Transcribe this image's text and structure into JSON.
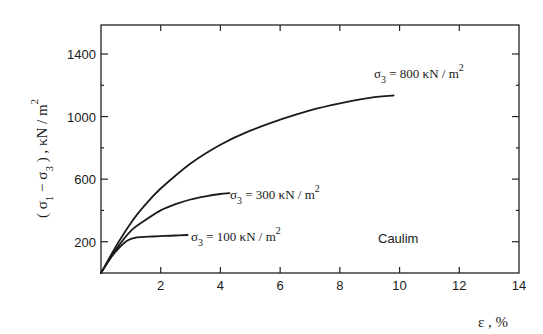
{
  "chart_data": {
    "type": "line",
    "title": "",
    "xlabel": "ε , %",
    "ylabel": "(σ1 − σ3) , κN / m2",
    "xlim": [
      0,
      14
    ],
    "ylim": [
      0,
      1550
    ],
    "x_ticks": [
      2,
      4,
      6,
      8,
      10,
      12,
      14
    ],
    "y_ticks": [
      200,
      600,
      1000,
      1400
    ],
    "y_minor_ticks": [
      400,
      800,
      1200
    ],
    "grid": false,
    "annotation": "Caulim",
    "series": [
      {
        "name": "σ3 = 800 κN / m2",
        "sigma3": 800,
        "x": [
          0,
          0.5,
          1,
          1.5,
          2,
          3,
          4,
          5,
          6,
          7,
          8,
          9,
          9.8
        ],
        "y": [
          0,
          170,
          320,
          440,
          540,
          700,
          820,
          910,
          980,
          1040,
          1085,
          1120,
          1135
        ]
      },
      {
        "name": "σ3 = 300 κN / m2",
        "sigma3": 300,
        "x": [
          0,
          0.5,
          1,
          1.5,
          2,
          2.5,
          3,
          3.5,
          4,
          4.3
        ],
        "y": [
          0,
          150,
          270,
          340,
          400,
          440,
          470,
          490,
          505,
          510
        ]
      },
      {
        "name": "σ3 = 100 κN / m2",
        "sigma3": 100,
        "x": [
          0,
          0.3,
          0.6,
          0.9,
          1.2,
          1.6,
          2,
          2.5,
          2.9
        ],
        "y": [
          0,
          90,
          160,
          210,
          228,
          232,
          236,
          240,
          243
        ]
      }
    ]
  },
  "labels": {
    "series_800": {
      "sigma": "σ",
      "sub": "3",
      "text": " = 800  κN / m",
      "sup": "2"
    },
    "series_300": {
      "sigma": "σ",
      "sub": "3",
      "text": " = 300  κN / m",
      "sup": "2"
    },
    "series_100": {
      "sigma": "σ",
      "sub": "3",
      "text": " = 100  κN / m",
      "sup": "2"
    },
    "annotation": "Caulim",
    "xlabel": "ε , %",
    "ylabel_main": "( σ",
    "ylabel_sub1": "1",
    "ylabel_mid": " − σ",
    "ylabel_sub3": "3",
    "ylabel_end": " ) , κN / m",
    "ylabel_sup": "2"
  }
}
